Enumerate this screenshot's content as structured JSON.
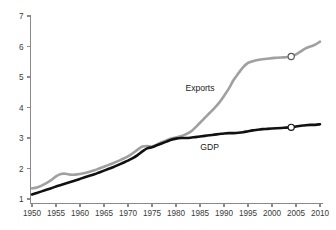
{
  "chart_data": {
    "type": "line",
    "title": "",
    "subtitle": "",
    "xlabel": "",
    "ylabel": "",
    "xlim": [
      1950,
      2010
    ],
    "ylim": [
      1,
      7
    ],
    "grid": false,
    "legend_position": "inline-annotations",
    "x_ticks": [
      1950,
      1955,
      1960,
      1965,
      1970,
      1975,
      1980,
      1985,
      1990,
      1995,
      2000,
      2005,
      2010
    ],
    "y_ticks": [
      1,
      2,
      3,
      4,
      5,
      6,
      7
    ],
    "x_tick_labels": [
      "1950",
      "1955",
      "1960",
      "1965",
      "1970",
      "1975",
      "1980",
      "1985",
      "1990",
      "1995",
      "2000",
      "2005",
      "2010"
    ],
    "y_tick_labels": [
      "1",
      "2",
      "3",
      "4",
      "5",
      "6",
      "7"
    ],
    "series": [
      {
        "name": "Exports",
        "color": "#a0a0a0",
        "label_text": "Exports",
        "label_x": 1985,
        "label_y": 4.55,
        "marker_x": 2004,
        "marker_y": 5.67,
        "x": [
          1950,
          1951,
          1952,
          1953,
          1954,
          1955,
          1956,
          1957,
          1958,
          1959,
          1960,
          1961,
          1962,
          1963,
          1964,
          1965,
          1966,
          1967,
          1968,
          1969,
          1970,
          1971,
          1972,
          1973,
          1974,
          1975,
          1976,
          1977,
          1978,
          1979,
          1980,
          1981,
          1982,
          1983,
          1984,
          1985,
          1986,
          1987,
          1988,
          1989,
          1990,
          1991,
          1992,
          1993,
          1994,
          1995,
          1996,
          1997,
          1998,
          1999,
          2000,
          2001,
          2002,
          2003,
          2004,
          2005,
          2006,
          2007,
          2008,
          2009,
          2010
        ],
        "values": [
          1.35,
          1.38,
          1.44,
          1.52,
          1.62,
          1.74,
          1.82,
          1.83,
          1.8,
          1.8,
          1.82,
          1.85,
          1.89,
          1.94,
          2.0,
          2.06,
          2.12,
          2.18,
          2.25,
          2.32,
          2.4,
          2.5,
          2.62,
          2.72,
          2.74,
          2.72,
          2.78,
          2.86,
          2.92,
          2.98,
          3.02,
          3.06,
          3.12,
          3.2,
          3.34,
          3.5,
          3.66,
          3.82,
          3.98,
          4.16,
          4.38,
          4.62,
          4.9,
          5.12,
          5.32,
          5.46,
          5.52,
          5.56,
          5.58,
          5.6,
          5.62,
          5.63,
          5.64,
          5.65,
          5.67,
          5.74,
          5.84,
          5.94,
          6.0,
          6.06,
          6.16
        ]
      },
      {
        "name": "GDP",
        "color": "#111111",
        "label_text": "GDP",
        "label_x": 1987,
        "label_y": 2.62,
        "marker_x": 2004,
        "marker_y": 3.35,
        "x": [
          1950,
          1951,
          1952,
          1953,
          1954,
          1955,
          1956,
          1957,
          1958,
          1959,
          1960,
          1961,
          1962,
          1963,
          1964,
          1965,
          1966,
          1967,
          1968,
          1969,
          1970,
          1971,
          1972,
          1973,
          1974,
          1975,
          1976,
          1977,
          1978,
          1979,
          1980,
          1981,
          1982,
          1983,
          1984,
          1985,
          1986,
          1987,
          1988,
          1989,
          1990,
          1991,
          1992,
          1993,
          1994,
          1995,
          1996,
          1997,
          1998,
          1999,
          2000,
          2001,
          2002,
          2003,
          2004,
          2005,
          2006,
          2007,
          2008,
          2009,
          2010
        ],
        "values": [
          1.15,
          1.2,
          1.25,
          1.3,
          1.35,
          1.41,
          1.46,
          1.51,
          1.56,
          1.61,
          1.66,
          1.71,
          1.76,
          1.81,
          1.87,
          1.93,
          1.99,
          2.05,
          2.12,
          2.19,
          2.26,
          2.34,
          2.44,
          2.56,
          2.66,
          2.7,
          2.76,
          2.82,
          2.88,
          2.94,
          2.98,
          3.0,
          3.0,
          3.01,
          3.03,
          3.05,
          3.07,
          3.09,
          3.11,
          3.13,
          3.15,
          3.16,
          3.16,
          3.17,
          3.19,
          3.22,
          3.25,
          3.27,
          3.29,
          3.3,
          3.31,
          3.32,
          3.33,
          3.34,
          3.35,
          3.38,
          3.4,
          3.42,
          3.43,
          3.43,
          3.45
        ]
      }
    ]
  }
}
